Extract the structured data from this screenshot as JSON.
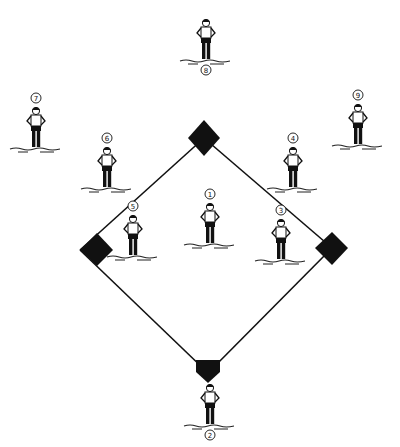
{
  "diagram": {
    "colors": {
      "ink": "#111111",
      "background": "#ffffff"
    },
    "bases": [
      {
        "id": "second-base",
        "name": "Second base"
      },
      {
        "id": "first-base",
        "name": "First base"
      },
      {
        "id": "third-base",
        "name": "Third base"
      },
      {
        "id": "home-plate",
        "name": "Home plate"
      }
    ],
    "players": [
      {
        "number": "1",
        "position": "pitcher"
      },
      {
        "number": "2",
        "position": "catcher"
      },
      {
        "number": "3",
        "position": "first-baseman"
      },
      {
        "number": "4",
        "position": "second-baseman"
      },
      {
        "number": "5",
        "position": "third-baseman"
      },
      {
        "number": "6",
        "position": "shortstop"
      },
      {
        "number": "7",
        "position": "left-fielder"
      },
      {
        "number": "8",
        "position": "center-fielder"
      },
      {
        "number": "9",
        "position": "right-fielder"
      }
    ]
  }
}
